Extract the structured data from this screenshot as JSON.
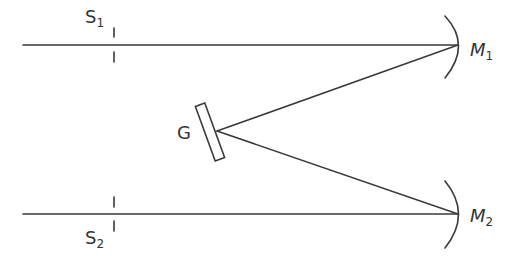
{
  "diagram": {
    "type": "optical-spectrometer-schematic",
    "colors": {
      "stroke": "#3a3a3a",
      "background": "#ffffff"
    },
    "labels": {
      "s1_main": "S",
      "s1_sub": "1",
      "s2_main": "S",
      "s2_sub": "2",
      "grating": "G",
      "m1_main": "M",
      "m1_sub": "1",
      "m2_main": "M",
      "m2_sub": "2"
    },
    "components": [
      {
        "id": "S1",
        "kind": "slit",
        "label": "S1"
      },
      {
        "id": "S2",
        "kind": "slit",
        "label": "S2"
      },
      {
        "id": "G",
        "kind": "diffraction-grating",
        "label": "G"
      },
      {
        "id": "M1",
        "kind": "concave-mirror",
        "label": "M1"
      },
      {
        "id": "M2",
        "kind": "concave-mirror",
        "label": "M2"
      }
    ],
    "beams": [
      {
        "from": "left",
        "through": "S1",
        "to": "M1"
      },
      {
        "from": "M1",
        "to": "G"
      },
      {
        "from": "G",
        "to": "M2"
      },
      {
        "from": "M2",
        "through": "S2",
        "to": "left"
      }
    ]
  }
}
